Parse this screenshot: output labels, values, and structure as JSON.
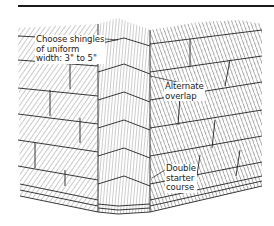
{
  "figure": {
    "colors": {
      "ink": "#1a1a1a",
      "hatch": "#555555",
      "paper": "#ffffff"
    },
    "labels": {
      "choose": {
        "lines": [
          "Choose shingles",
          "of uniform",
          "width: 3\" to 5\""
        ]
      },
      "alternate": {
        "lines": [
          "Alternate",
          "overlap"
        ]
      },
      "double": {
        "lines": [
          "Double",
          "starter",
          "course"
        ]
      }
    }
  }
}
